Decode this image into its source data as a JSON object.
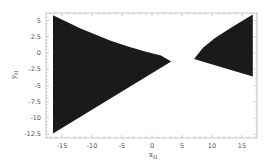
{
  "chart_data": {
    "type": "area",
    "title": "",
    "xlabel": "x_H",
    "ylabel": "y_H",
    "xlim": [
      -17,
      17
    ],
    "ylim": [
      -13,
      6.5
    ],
    "x_ticks": [
      -15,
      -10,
      -5,
      0,
      5,
      10,
      15
    ],
    "y_ticks": [
      5,
      2.5,
      0,
      -2.5,
      -5,
      -7.5,
      -10,
      -12.5
    ],
    "x_tick_labels": [
      "-15",
      "-10",
      "-5",
      "0",
      "5",
      "10",
      "15"
    ],
    "y_tick_labels": [
      "5",
      "2.5",
      "0",
      "-2.5",
      "-5",
      "-7.5",
      "-10",
      "-12.5"
    ],
    "grid": false,
    "legend": null,
    "series": [
      {
        "name": "left region",
        "fill": "#1a1a1a",
        "boundary": [
          [
            -16.5,
            5.8
          ],
          [
            -12,
            3.8
          ],
          [
            -7,
            1.9
          ],
          [
            -4,
            1.0
          ],
          [
            -1,
            0.2
          ],
          [
            1.5,
            -0.4
          ],
          [
            3.2,
            -1.3
          ],
          [
            -16.5,
            -12.4
          ]
        ]
      },
      {
        "name": "right region",
        "fill": "#1a1a1a",
        "boundary": [
          [
            7.0,
            -0.9
          ],
          [
            8.5,
            0.8
          ],
          [
            10.5,
            2.3
          ],
          [
            13.5,
            4.1
          ],
          [
            16.8,
            5.9
          ],
          [
            16.8,
            -3.6
          ]
        ]
      }
    ]
  },
  "axes": {
    "x_label": "x",
    "x_label_sub": "H",
    "y_label": "y",
    "y_label_sub": "H"
  }
}
